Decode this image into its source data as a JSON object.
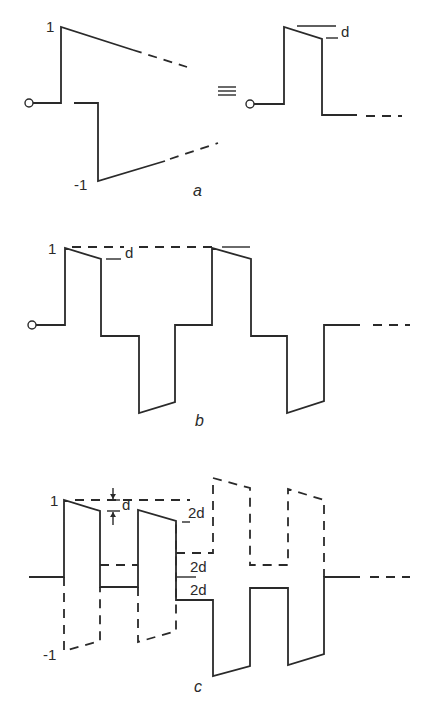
{
  "figure": {
    "panels": [
      {
        "id": "a",
        "caption": "a",
        "labels": {
          "high": "1",
          "low": "-1",
          "drop": "d",
          "equivalence": "≡"
        }
      },
      {
        "id": "b",
        "caption": "b",
        "labels": {
          "high": "1",
          "drop": "d"
        }
      },
      {
        "id": "c",
        "caption": "c",
        "labels": {
          "high": "1",
          "low": "-1",
          "drop": "d",
          "step1": "2d",
          "step2": "2d",
          "step3": "2d"
        }
      }
    ]
  }
}
